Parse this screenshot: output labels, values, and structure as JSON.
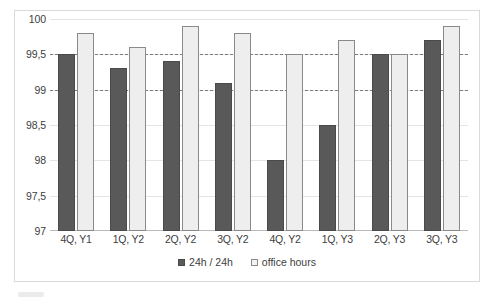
{
  "chart_data": {
    "type": "bar",
    "title": "",
    "xlabel": "",
    "ylabel": "",
    "categories": [
      "4Q, Y1",
      "1Q, Y2",
      "2Q, Y2",
      "3Q, Y2",
      "4Q, Y2",
      "1Q, Y3",
      "2Q, Y3",
      "3Q, Y3"
    ],
    "series": [
      {
        "name": "24h / 24h",
        "color": "#595959",
        "values": [
          99.5,
          99.3,
          99.4,
          99.1,
          98.0,
          98.5,
          99.5,
          99.7
        ]
      },
      {
        "name": "office hours",
        "color": "#eeeeee",
        "values": [
          99.8,
          99.6,
          99.9,
          99.8,
          99.5,
          99.7,
          99.5,
          99.9
        ]
      }
    ],
    "ylim": [
      97,
      100
    ],
    "yticks": [
      97,
      97.5,
      98,
      98.5,
      99,
      99.5,
      100
    ],
    "ytick_labels": [
      "97",
      "97,5",
      "98",
      "98,5",
      "99",
      "99,5",
      "100"
    ],
    "reference_lines": [
      {
        "value": 99.5,
        "style": "dashed"
      },
      {
        "value": 99.0,
        "style": "dashed"
      }
    ],
    "grid": true,
    "legend_position": "bottom"
  }
}
